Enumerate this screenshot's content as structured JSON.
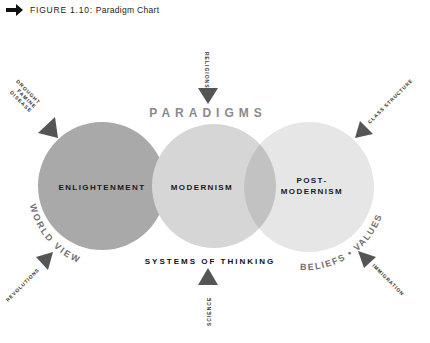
{
  "header": {
    "figure_number": "FIGURE 1.10:",
    "figure_title": "Paradigm Chart",
    "icon": "right-arrow-icon"
  },
  "diagram": {
    "title": "PARADIGMS",
    "subtitle_bottom": "SYSTEMS OF THINKING",
    "circles": [
      {
        "label": "ENLIGHTENMENT",
        "color": "#a9a9a9"
      },
      {
        "label": "MODERNISM",
        "color": "#d3d3d3"
      },
      {
        "label_line1": "POST-",
        "label_line2": "MODERNISM",
        "color": "#e6e6e6"
      }
    ],
    "overlap_color": "#bfbfbf",
    "arc_labels": {
      "left": "WORLD VIEW",
      "right": "BELIEFS • VALUES"
    },
    "forces": [
      {
        "label": "RELIGIONS",
        "position": "top"
      },
      {
        "label_line1": "DROUGHT",
        "label_line2": "FAMINE",
        "label_line3": "DISEASE",
        "position": "top-left"
      },
      {
        "label": "CLASS STRUCTURE",
        "position": "top-right"
      },
      {
        "label": "REVOLUTIONS",
        "position": "bottom-left"
      },
      {
        "label": "SCIENCE",
        "position": "bottom"
      },
      {
        "label": "IMMIGRATION",
        "position": "bottom-right"
      }
    ],
    "arrow_color": "#555555",
    "title_color": "#8a8a8a",
    "arc_label_color": "#6e6e6e"
  }
}
